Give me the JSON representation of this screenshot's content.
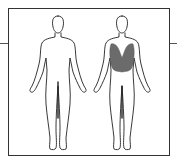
{
  "diagram": {
    "views": [
      {
        "label": "front",
        "highlighted_regions": []
      },
      {
        "label": "back",
        "highlighted_regions": [
          "upper-back"
        ]
      }
    ],
    "colors": {
      "outline": "#222222",
      "highlight": "#6b6b6b",
      "frame": "#333333",
      "connector": "#555555"
    }
  }
}
